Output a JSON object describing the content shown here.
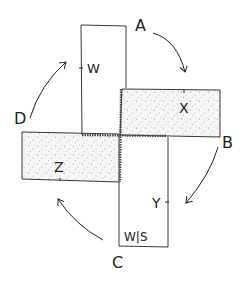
{
  "diagram": {
    "type": "rotation-pinwheel",
    "corner_labels": {
      "a": "A",
      "b": "B",
      "c": "C",
      "d": "D"
    },
    "rectangles": {
      "top": {
        "label": "W",
        "fill": "plain"
      },
      "right": {
        "label": "X",
        "fill": "stippled"
      },
      "left": {
        "label": "Z",
        "fill": "stippled"
      },
      "bottom": {
        "label": "Y",
        "corner_label": "W|S",
        "fill": "plain"
      }
    },
    "arrows": [
      {
        "from": "A",
        "to": "B",
        "direction": "clockwise"
      },
      {
        "from": "B",
        "to": "C",
        "direction": "clockwise"
      },
      {
        "from": "C",
        "to": "D",
        "direction": "clockwise"
      },
      {
        "from": "D",
        "to": "A",
        "direction": "clockwise"
      }
    ],
    "colors": {
      "line": "#222222",
      "stipple": "#888888",
      "background": "#ffffff"
    }
  }
}
